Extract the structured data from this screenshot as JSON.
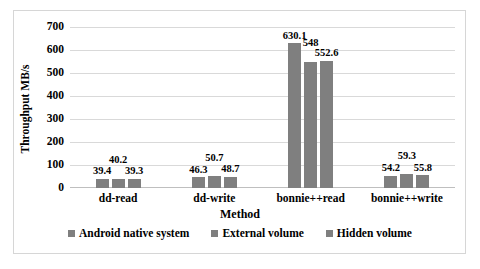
{
  "chart_data": {
    "type": "bar",
    "title": "",
    "xlabel": "Method",
    "ylabel": "Throughput MB/s",
    "categories": [
      "dd-read",
      "dd-write",
      "bonnie++read",
      "bonnie++write"
    ],
    "series": [
      {
        "name": "Android native system",
        "color": "#7f7f7f",
        "values": [
          39.4,
          46.3,
          630.1,
          54.2
        ],
        "labels": [
          "39.4",
          "46.3",
          "630.1",
          "54.2"
        ]
      },
      {
        "name": "External volume",
        "color": "#7f7f7f",
        "values": [
          40.2,
          50.7,
          548,
          59.3
        ],
        "labels": [
          "40.2",
          "50.7",
          "548",
          "59.3"
        ]
      },
      {
        "name": "Hidden volume",
        "color": "#7f7f7f",
        "values": [
          39.3,
          48.7,
          552.6,
          55.8
        ],
        "labels": [
          "39.3",
          "48.7",
          "552.6",
          "55.8"
        ]
      }
    ],
    "ylim": [
      0,
      700
    ],
    "yticks": [
      0,
      100,
      200,
      300,
      400,
      500,
      600,
      700
    ],
    "ytick_labels": [
      "0",
      "100",
      "200",
      "300",
      "400",
      "500",
      "600",
      "700"
    ],
    "grid": true,
    "legend_position": "bottom",
    "gridline_color": "#d9d9d9",
    "bar_color": "#7f7f7f",
    "frame_color": "#d6d6d6"
  }
}
